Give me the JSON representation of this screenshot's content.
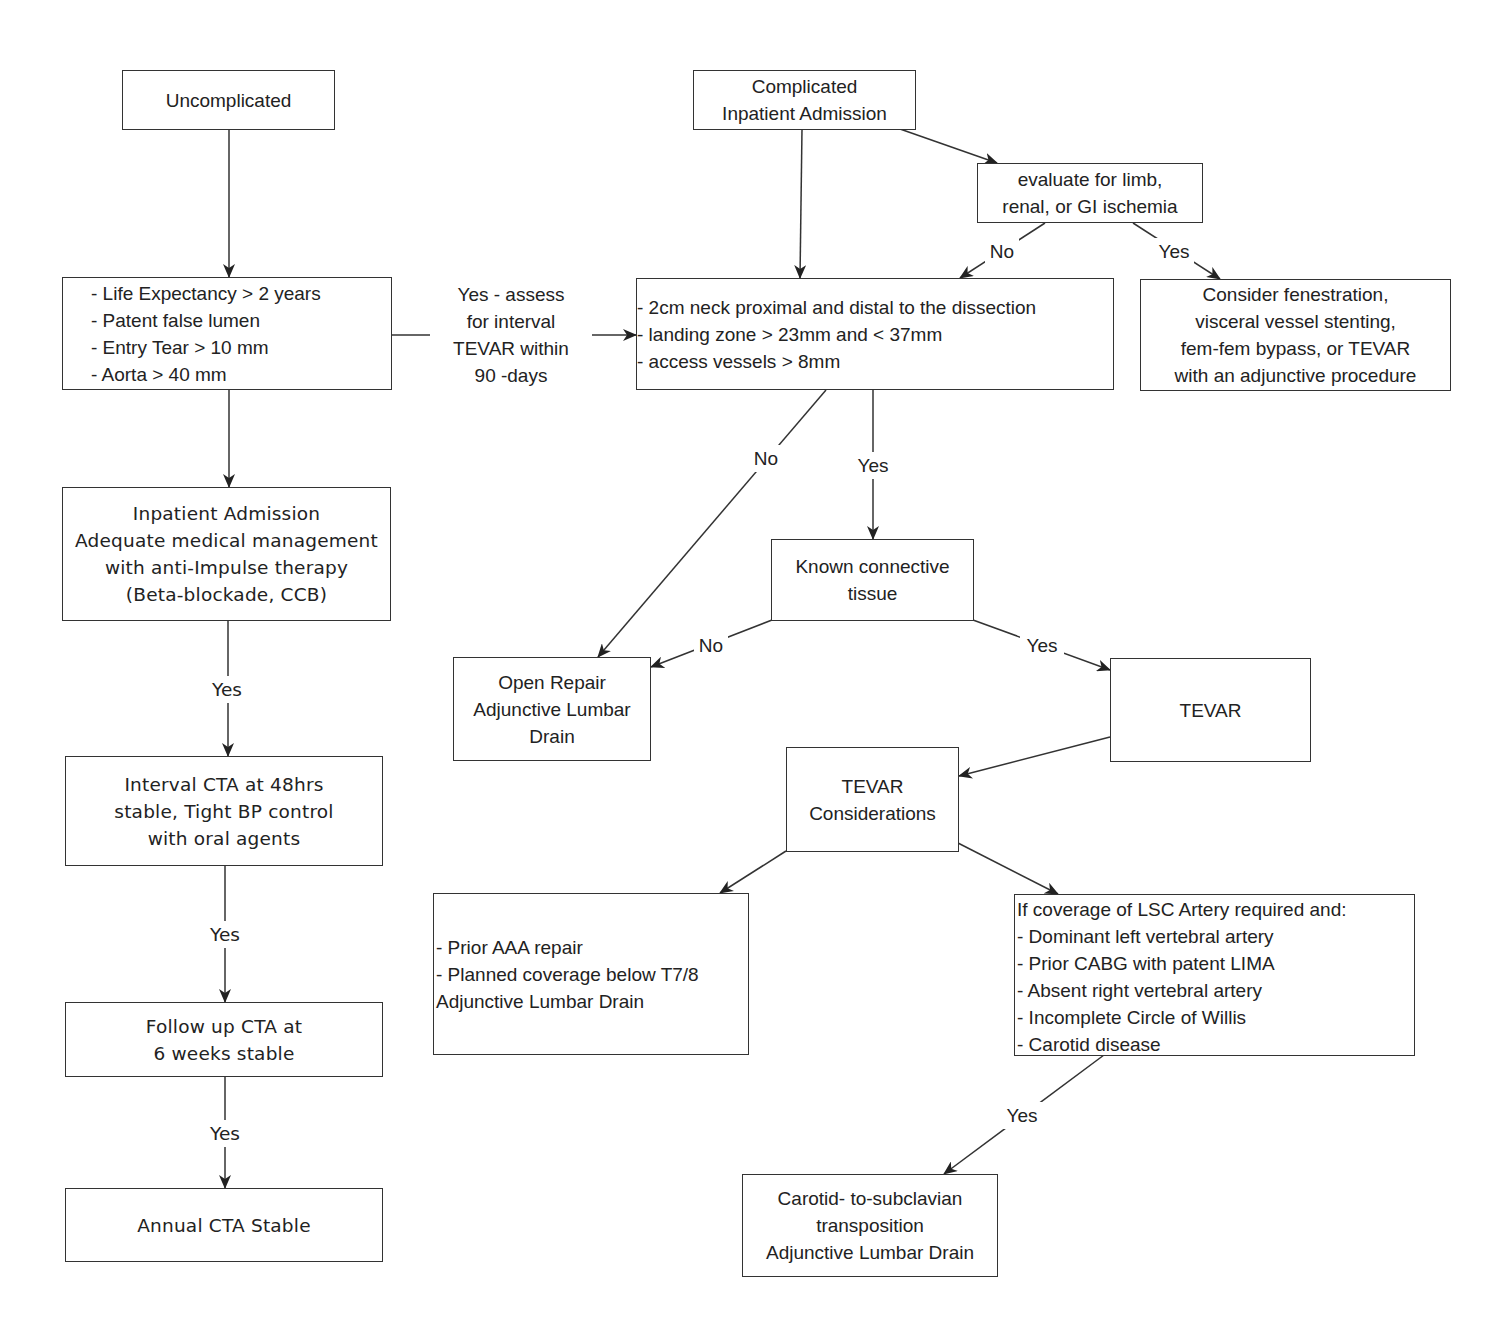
{
  "diagram": {
    "type": "flowchart",
    "colors": {
      "stroke": "#333333",
      "text": "#222222",
      "background": "#ffffff"
    },
    "nodes": {
      "uncomplicated": {
        "lines": [
          "Uncomplicated"
        ]
      },
      "criteria_left": {
        "lines": [
          "- Life Expectancy > 2 years",
          "- Patent false lumen",
          "- Entry Tear > 10 mm",
          "- Aorta > 40 mm"
        ]
      },
      "inpatient_admission": {
        "lines": [
          "Inpatient Admission",
          "Adequate medical management",
          "with anti-Impulse therapy",
          "(Beta-blockade, CCB)"
        ]
      },
      "interval_cta": {
        "lines": [
          "Interval CTA at 48hrs",
          "stable, Tight BP control",
          "with oral agents"
        ]
      },
      "follow_up_cta": {
        "lines": [
          "Follow up CTA at",
          "6 weeks stable"
        ]
      },
      "annual_cta": {
        "lines": [
          "Annual CTA Stable"
        ]
      },
      "complicated": {
        "lines": [
          "Complicated",
          "Inpatient Admission"
        ]
      },
      "evaluate_ischemia": {
        "lines": [
          "evaluate for limb,",
          "renal, or GI ischemia"
        ]
      },
      "anatomic_criteria": {
        "lines": [
          "- 2cm neck proximal and distal to the dissection",
          "- landing zone > 23mm and < 37mm",
          "- access vessels > 8mm"
        ]
      },
      "consider_fenestration": {
        "lines": [
          "Consider fenestration,",
          "visceral vessel stenting,",
          "fem-fem bypass, or TEVAR",
          "with an adjunctive procedure"
        ]
      },
      "known_connective": {
        "lines": [
          "Known connective",
          "tissue"
        ]
      },
      "open_repair": {
        "lines": [
          "Open Repair",
          "Adjunctive Lumbar",
          "Drain"
        ]
      },
      "tevar": {
        "lines": [
          "TEVAR"
        ]
      },
      "tevar_considerations": {
        "lines": [
          "TEVAR",
          "Considerations"
        ]
      },
      "prior_aaa": {
        "lines": [
          "- Prior AAA repair",
          "- Planned coverage below T7/8",
          "Adjunctive Lumbar Drain"
        ]
      },
      "lsc_coverage": {
        "lines": [
          "If coverage of LSC Artery required and:",
          "- Dominant left vertebral artery",
          "- Prior CABG with patent LIMA",
          "- Absent right vertebral artery",
          "- Incomplete Circle of Willis",
          "- Carotid disease"
        ]
      },
      "carotid_subclavian": {
        "lines": [
          "Carotid- to-subclavian",
          "transposition",
          "Adjunctive Lumbar Drain"
        ]
      }
    },
    "edge_labels": {
      "yes_assess": [
        "Yes - assess",
        "for interval",
        "TEVAR within",
        "90 -days"
      ],
      "yes_1": "Yes",
      "yes_2": "Yes",
      "yes_3": "Yes",
      "eval_no": "No",
      "eval_yes": "Yes",
      "anat_no": "No",
      "anat_yes": "Yes",
      "ct_no": "No",
      "ct_yes": "Yes",
      "lsc_yes": "Yes"
    }
  }
}
